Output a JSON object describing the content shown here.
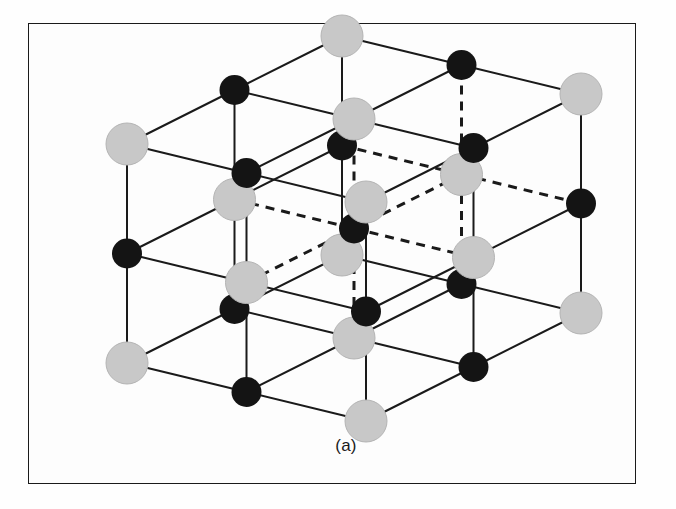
{
  "figure": {
    "caption": "(a)",
    "kind": "crystal-structure-unit-cell",
    "frame": {
      "border_color": "#3a3a3a",
      "background": "#fdfdfd",
      "x": 28,
      "y": 23,
      "width": 608,
      "height": 461
    },
    "palette": {
      "atom_light": "#c8c8c8",
      "atom_light_stroke": "#b4b4b4",
      "atom_dark": "#141414",
      "bond_solid": "#1a1a1a",
      "bond_dashed": "#1a1a1a",
      "page_background": "#ffffff"
    },
    "bond_style": {
      "solid_width": 2.0,
      "dashed_width": 3.0,
      "dash_pattern": "9 7"
    },
    "atom_radius": {
      "light": 21,
      "dark": 15
    },
    "projection": {
      "origin_x": 127,
      "origin_y": 363,
      "ax_x": 119.5,
      "ax_y": 29,
      "ay_x": 107.5,
      "ay_y": -54,
      "az_x": 0,
      "az_y": -109.5,
      "steps": 2
    },
    "legend": {
      "light_atom_label": "larger ion (light sphere)",
      "dark_atom_label": "smaller ion (dark sphere)"
    }
  }
}
